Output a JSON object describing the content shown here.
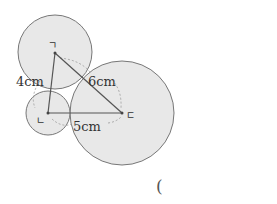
{
  "diagram": {
    "circles": [
      {
        "name": "top",
        "cx": 55,
        "cy": 52,
        "r": 37
      },
      {
        "name": "bottom-left",
        "cx": 48,
        "cy": 113,
        "r": 22
      },
      {
        "name": "right",
        "cx": 122,
        "cy": 113,
        "r": 52
      }
    ],
    "points": {
      "a": {
        "label": "ㄱ",
        "x": 55,
        "y": 53
      },
      "b": {
        "label": "ㄴ",
        "x": 48,
        "y": 113
      },
      "c": {
        "label": "ㄷ",
        "x": 122,
        "y": 113
      }
    },
    "edges": {
      "ab": {
        "label": "4cm"
      },
      "ac": {
        "label": "6cm"
      },
      "bc": {
        "label": "5cm"
      }
    },
    "colors": {
      "circle_fill": "#e8e8e8",
      "circle_stroke": "#777777",
      "line": "#555555",
      "dashed": "#999999"
    }
  },
  "answer": {
    "paren": "("
  }
}
